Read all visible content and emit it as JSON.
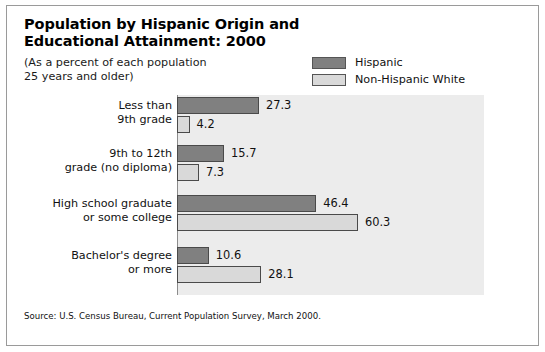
{
  "figure": {
    "title_lines": [
      "Population by Hispanic Origin and",
      "Educational Attainment: 2000"
    ],
    "subtitle_lines": [
      "(As a percent of each population",
      "25 years and older)"
    ],
    "source": "Source: U.S. Census Bureau, Current Population Survey, March 2000."
  },
  "colors": {
    "hispanic": "#808080",
    "non_hispanic_white": "#d9d9d9",
    "bar_border": "#4a4a4a",
    "plot_band": "#ececec",
    "axis": "#8c8c8c",
    "frame": "#9a9a9a",
    "text": "#111111"
  },
  "legend": {
    "items": [
      {
        "label": "Hispanic",
        "color": "#808080"
      },
      {
        "label": "Non-Hispanic White",
        "color": "#d9d9d9"
      }
    ]
  },
  "chart_data": {
    "type": "bar",
    "orientation": "horizontal",
    "title": "Population by Hispanic Origin and Educational Attainment: 2000",
    "subtitle": "(As a percent of each population 25 years and older)",
    "xlabel": "",
    "ylabel": "",
    "xlim": [
      0,
      65
    ],
    "grid": false,
    "legend_position": "top-right",
    "value_labels": true,
    "categories": [
      "Less than 9th grade",
      "9th to 12th grade (no diploma)",
      "High school graduate or some college",
      "Bachelor's degree or more"
    ],
    "category_label_lines": [
      [
        "Less than",
        "9th grade"
      ],
      [
        "9th to 12th",
        "grade (no diploma)"
      ],
      [
        "High school graduate",
        "or some college"
      ],
      [
        "Bachelor's degree",
        "or more"
      ]
    ],
    "series": [
      {
        "name": "Hispanic",
        "color": "#808080",
        "values": [
          27.3,
          15.7,
          46.4,
          10.6
        ]
      },
      {
        "name": "Non-Hispanic White",
        "color": "#d9d9d9",
        "values": [
          4.2,
          7.3,
          60.3,
          28.1
        ]
      }
    ],
    "source": "Source: U.S. Census Bureau, Current Population Survey, March 2000."
  }
}
